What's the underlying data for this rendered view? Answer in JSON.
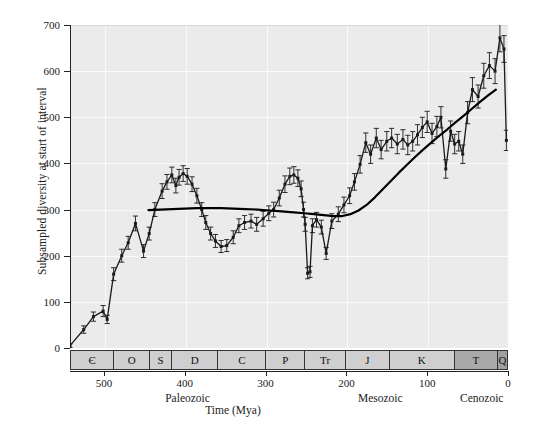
{
  "chart_data": {
    "type": "line",
    "title": "",
    "xlabel": "Time (Mya)",
    "ylabel": "Subsampled diversity at start of interval",
    "xlim": [
      542,
      0
    ],
    "ylim": [
      0,
      700
    ],
    "x_reversed": true,
    "grid": true,
    "legend": "none",
    "y_ticks": [
      0,
      100,
      200,
      300,
      400,
      500,
      600,
      700
    ],
    "x_ticks": [
      500,
      400,
      300,
      200,
      100,
      0
    ],
    "series": [
      {
        "name": "Subsampled diversity",
        "style": "line-with-points-and-errorbars",
        "x": [
          542,
          525,
          513,
          501,
          496,
          488,
          478,
          470,
          461,
          451,
          444,
          437,
          428,
          422,
          416,
          411,
          407,
          402,
          397,
          391,
          385,
          379,
          374,
          368,
          362,
          355,
          348,
          340,
          333,
          326,
          318,
          311,
          303,
          296,
          290,
          283,
          276,
          270,
          265,
          260,
          256,
          253,
          251,
          248,
          245,
          242,
          237,
          231,
          225,
          218,
          210,
          203,
          196,
          190,
          183,
          176,
          170,
          163,
          157,
          150,
          144,
          137,
          130,
          124,
          118,
          112,
          106,
          100,
          94,
          88,
          83,
          77,
          71,
          66,
          61,
          56,
          50,
          44,
          37,
          30,
          23,
          16,
          10,
          5,
          2
        ],
        "y": [
          5,
          40,
          68,
          80,
          62,
          160,
          200,
          228,
          270,
          210,
          248,
          300,
          340,
          360,
          375,
          352,
          370,
          378,
          372,
          355,
          330,
          300,
          272,
          248,
          232,
          220,
          222,
          240,
          265,
          272,
          275,
          268,
          280,
          292,
          300,
          325,
          355,
          372,
          375,
          368,
          345,
          300,
          268,
          162,
          165,
          265,
          278,
          262,
          205,
          275,
          290,
          310,
          330,
          360,
          398,
          445,
          420,
          455,
          430,
          448,
          455,
          442,
          452,
          440,
          448,
          462,
          478,
          490,
          465,
          480,
          500,
          388,
          470,
          442,
          448,
          420,
          510,
          560,
          545,
          590,
          612,
          600,
          672,
          648,
          450
        ],
        "yerr": [
          4,
          8,
          10,
          12,
          9,
          14,
          14,
          14,
          16,
          14,
          14,
          15,
          16,
          16,
          17,
          16,
          17,
          17,
          17,
          16,
          16,
          15,
          15,
          14,
          14,
          13,
          13,
          14,
          15,
          15,
          15,
          15,
          16,
          16,
          16,
          17,
          18,
          18,
          18,
          18,
          17,
          16,
          15,
          12,
          12,
          15,
          16,
          15,
          13,
          16,
          16,
          17,
          17,
          18,
          19,
          21,
          20,
          21,
          20,
          21,
          21,
          21,
          21,
          21,
          21,
          22,
          22,
          23,
          22,
          22,
          23,
          20,
          22,
          21,
          21,
          20,
          24,
          26,
          25,
          27,
          28,
          27,
          30,
          29,
          22
        ]
      },
      {
        "name": "Smoothed trend",
        "style": "smooth-line",
        "x": [
          445,
          430,
          415,
          400,
          385,
          370,
          355,
          340,
          325,
          310,
          295,
          280,
          265,
          252,
          240,
          228,
          216,
          205,
          195,
          185,
          175,
          165,
          155,
          145,
          135,
          125,
          115,
          105,
          95,
          85,
          75,
          65,
          55,
          45,
          35,
          25,
          15
        ],
        "y": [
          299,
          300,
          301,
          302,
          303,
          303,
          303,
          302,
          301,
          300,
          298,
          296,
          294,
          292,
          290,
          288,
          286,
          286,
          290,
          298,
          310,
          326,
          344,
          362,
          380,
          397,
          414,
          430,
          445,
          460,
          474,
          489,
          503,
          518,
          533,
          547,
          560
        ]
      }
    ],
    "periods": [
      {
        "symbol": "Є",
        "name": "Cambrian",
        "start": 542,
        "end": 488,
        "shade": "light"
      },
      {
        "symbol": "O",
        "name": "Ordovician",
        "start": 488,
        "end": 444,
        "shade": "light"
      },
      {
        "symbol": "S",
        "name": "Silurian",
        "start": 444,
        "end": 416,
        "shade": "light"
      },
      {
        "symbol": "D",
        "name": "Devonian",
        "start": 416,
        "end": 359,
        "shade": "light"
      },
      {
        "symbol": "C",
        "name": "Carboniferous",
        "start": 359,
        "end": 299,
        "shade": "light"
      },
      {
        "symbol": "P",
        "name": "Permian",
        "start": 299,
        "end": 251,
        "shade": "light"
      },
      {
        "symbol": "Tr",
        "name": "Triassic",
        "start": 251,
        "end": 200,
        "shade": "light"
      },
      {
        "symbol": "J",
        "name": "Jurassic",
        "start": 200,
        "end": 146,
        "shade": "light"
      },
      {
        "symbol": "K",
        "name": "Cretaceous",
        "start": 146,
        "end": 65,
        "shade": "light"
      },
      {
        "symbol": "T",
        "name": "Tertiary",
        "start": 65,
        "end": 11,
        "shade": "dark"
      },
      {
        "symbol": "Q",
        "name": "Quaternary",
        "start": 11,
        "end": 0,
        "shade": "darker"
      }
    ],
    "eras": [
      {
        "label": "Paleozoic",
        "start": 542,
        "end": 251
      },
      {
        "label": "Mesozoic",
        "start": 251,
        "end": 65
      },
      {
        "label": "Cenozoic",
        "start": 65,
        "end": 0
      }
    ],
    "colors": {
      "plot_background": "#ebebeb",
      "data_line": "#1a1a1a",
      "trend_line": "#000000",
      "period_light": "#cfcfcf",
      "period_dark": "#a9a9a9",
      "gridline": "#fafafa",
      "axis": "#222222"
    }
  }
}
